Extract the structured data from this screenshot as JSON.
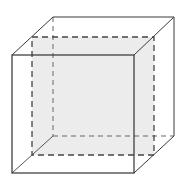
{
  "diagram": {
    "colors": {
      "background": "#ffffff",
      "edge": "#3a3a3a",
      "hidden_edge": "#555555",
      "section_fill": "#ececec"
    },
    "front_face": {
      "x1": 12,
      "y1": 55,
      "x2": 134,
      "y2": 173
    },
    "back_face": {
      "x1": 53,
      "y1": 17,
      "x2": 174,
      "y2": 136
    },
    "section_square": {
      "x1": 32,
      "y1": 37,
      "x2": 154,
      "y2": 155
    }
  }
}
